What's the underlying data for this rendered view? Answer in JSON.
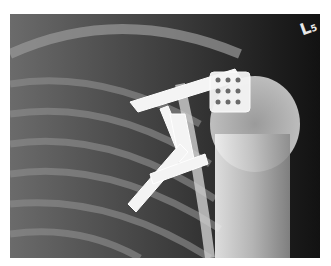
{
  "image": {
    "description": "Shoulder X-ray with surgical fixation plates and screws over clavicle/acromion region",
    "marker": {
      "letter": "L",
      "sub": "5"
    },
    "colors": {
      "background": "#ffffff",
      "film_dark": "#1a1a1a",
      "bone": "#bdbdbd",
      "hardware": "#f4f4f4"
    }
  }
}
